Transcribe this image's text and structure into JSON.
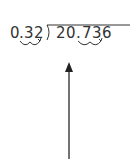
{
  "problem": {
    "divisor": "0.32",
    "dividend": "20.736",
    "divisor_chars": [
      "0",
      ".",
      "3",
      "2"
    ],
    "dividend_chars": [
      "2",
      "0",
      ".",
      "7",
      "3",
      "6"
    ]
  },
  "annotations": {
    "divisor_decimal_hops": 2,
    "dividend_decimal_hops": 2,
    "arrow_direction": "up"
  },
  "colors": {
    "ink": "#333333",
    "background": "#ffffff"
  }
}
